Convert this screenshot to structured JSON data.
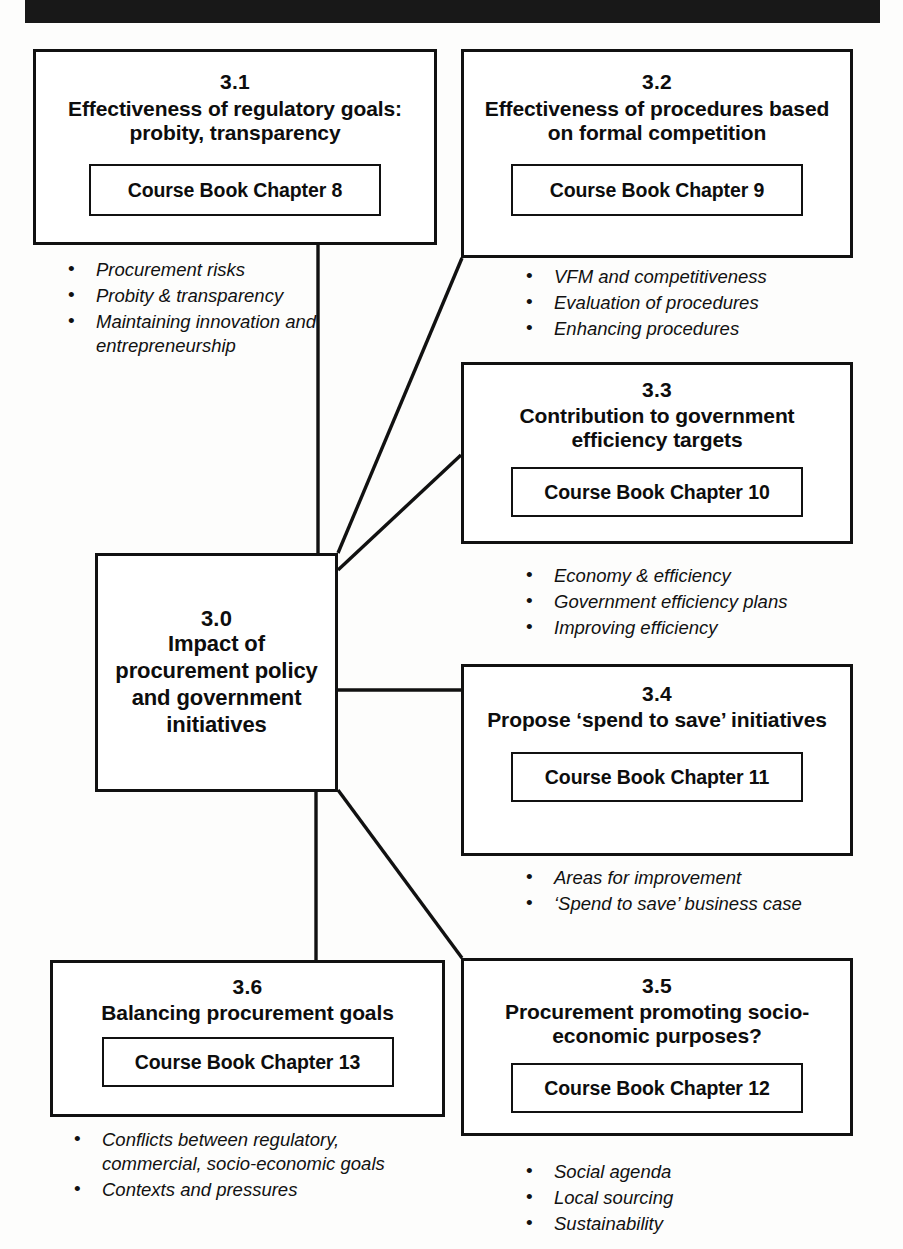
{
  "banner": {
    "label": "black-header-bar"
  },
  "nodes": {
    "n30": {
      "number": "3.0",
      "title": "Impact of procurement policy and government initiatives"
    },
    "n31": {
      "number": "3.1",
      "title": "Effectiveness of regulatory goals: probity, transparency",
      "chapter": "Course Book Chapter 8",
      "bullets": [
        "Procurement risks",
        "Probity & transparency",
        "Maintaining innovation and entrepreneurship"
      ]
    },
    "n32": {
      "number": "3.2",
      "title": "Effectiveness of procedures based on formal competition",
      "chapter": "Course Book Chapter 9",
      "bullets": [
        "VFM and competitiveness",
        "Evaluation of procedures",
        "Enhancing procedures"
      ]
    },
    "n33": {
      "number": "3.3",
      "title": "Contribution to government efficiency targets",
      "chapter": "Course Book Chapter 10",
      "bullets": [
        "Economy & efficiency",
        "Government efficiency plans",
        "Improving efficiency"
      ]
    },
    "n34": {
      "number": "3.4",
      "title": "Propose ‘spend to save’ initiatives",
      "chapter": "Course Book Chapter 11",
      "bullets": [
        "Areas for improvement",
        "‘Spend to save’ business case"
      ]
    },
    "n35": {
      "number": "3.5",
      "title": "Procurement promoting socio-economic purposes?",
      "chapter": "Course Book Chapter 12",
      "bullets": [
        "Social agenda",
        "Local sourcing",
        "Sustainability"
      ]
    },
    "n36": {
      "number": "3.6",
      "title": "Balancing procurement goals",
      "chapter": "Course Book Chapter 13",
      "bullets": [
        "Conflicts between regulatory, commercial, socio-economic goals",
        "Contexts and pressures"
      ]
    }
  },
  "colors": {
    "ink": "#111111",
    "banner": "#181818",
    "paper": "#fdfdfc"
  }
}
